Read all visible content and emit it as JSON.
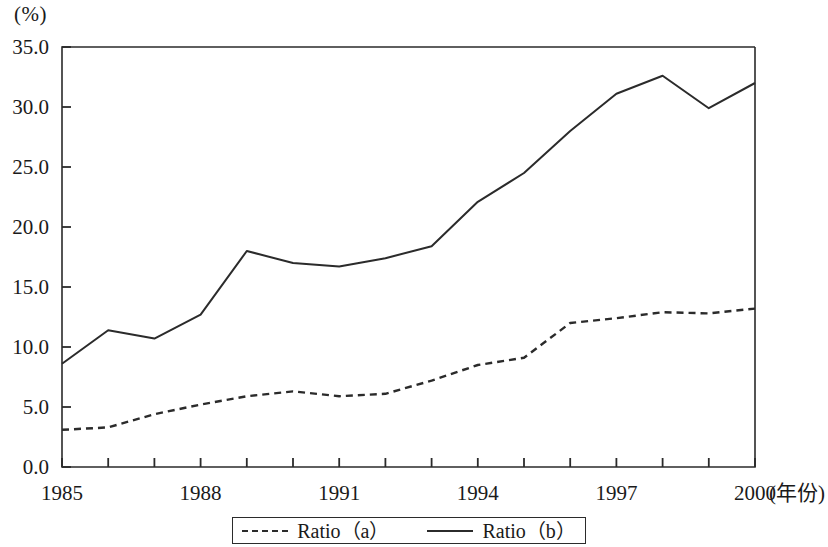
{
  "axis": {
    "unit_label": "(%)",
    "x_title": "(年份)",
    "y_ticks": [
      "0.0",
      "5.0",
      "10.0",
      "15.0",
      "20.0",
      "25.0",
      "30.0",
      "35.0"
    ],
    "x_ticks_labeled": [
      "1985",
      "1988",
      "1991",
      "1994",
      "1997",
      "2000"
    ]
  },
  "legend": {
    "entries": [
      {
        "label": "Ratio（a）",
        "style": "dashed"
      },
      {
        "label": "Ratio（b）",
        "style": "solid"
      }
    ]
  },
  "colors": {
    "line": "#2b2b2b",
    "axis": "#2b2b2b",
    "background": "#ffffff"
  },
  "chart_data": {
    "type": "line",
    "title": "",
    "subtitle": "",
    "xlabel": "(年份)",
    "ylabel": "(%)",
    "xlim": [
      1985,
      2000
    ],
    "ylim": [
      0.0,
      35.0
    ],
    "ytick_step": 5.0,
    "xtick_step": 1,
    "xtick_label_step": 3,
    "grid": false,
    "legend_position": "bottom",
    "x": [
      1985,
      1986,
      1987,
      1988,
      1989,
      1990,
      1991,
      1992,
      1993,
      1994,
      1995,
      1996,
      1997,
      1998,
      1999,
      2000
    ],
    "series": [
      {
        "name": "Ratio（a）",
        "style": "dashed",
        "values": [
          3.1,
          3.3,
          4.4,
          5.2,
          5.9,
          6.3,
          5.9,
          6.1,
          7.2,
          8.5,
          9.1,
          12.0,
          12.4,
          12.9,
          12.8,
          13.2
        ]
      },
      {
        "name": "Ratio（b）",
        "style": "solid",
        "values": [
          8.6,
          11.4,
          10.7,
          12.7,
          18.0,
          17.0,
          16.7,
          17.4,
          18.4,
          22.1,
          24.5,
          28.0,
          31.1,
          32.6,
          29.9,
          32.0
        ]
      }
    ]
  }
}
